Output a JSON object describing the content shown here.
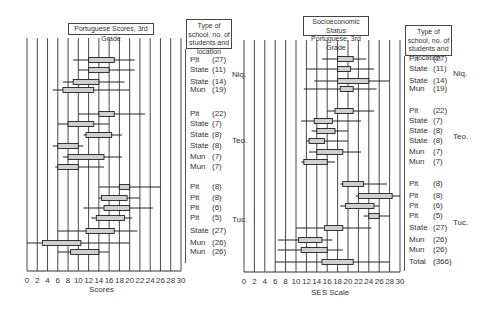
{
  "chart_data": [
    {
      "type": "boxplot",
      "title": "Portuguese Scores, 3rd Grade",
      "xlabel": "Scores",
      "ylabel": "",
      "xlim": [
        0,
        30
      ],
      "x_ticks": [
        0,
        2,
        4,
        6,
        8,
        10,
        12,
        14,
        16,
        18,
        20,
        22,
        24,
        26,
        28,
        30
      ],
      "grid": true,
      "legend_header": "Type of school, no. of students and location",
      "groups": [
        {
          "location": "Niq.",
          "rows": [
            {
              "type": "Pit",
              "n": "(27)",
              "whisker_low": 9,
              "q1": 12,
              "q3": 17,
              "whisker_high": 21
            },
            {
              "type": "State",
              "n": "(11)",
              "whisker_low": 10,
              "q1": 12,
              "q3": 16,
              "whisker_high": 21
            },
            {
              "type": "State",
              "n": "(14)",
              "whisker_low": 7,
              "q1": 9,
              "q3": 14,
              "whisker_high": 19
            },
            {
              "type": "Mun",
              "n": "(19)",
              "whisker_low": 5,
              "q1": 7,
              "q3": 13,
              "whisker_high": 20
            }
          ]
        },
        {
          "location": "Teo.",
          "rows": [
            {
              "type": "Pit",
              "n": "(22)",
              "whisker_low": 10,
              "q1": 14,
              "q3": 17,
              "whisker_high": 23
            },
            {
              "type": "State",
              "n": "(7)",
              "whisker_low": 6,
              "q1": 8,
              "q3": 13,
              "whisker_high": 16
            },
            {
              "type": "State",
              "n": "(8)",
              "whisker_low": 11,
              "q1": 11.5,
              "q3": 16.5,
              "whisker_high": 18.5
            },
            {
              "type": "State",
              "n": "(8)",
              "whisker_low": 5,
              "q1": 6,
              "q3": 10,
              "whisker_high": 11
            },
            {
              "type": "Mun",
              "n": "(7)",
              "whisker_low": 7,
              "q1": 8,
              "q3": 15,
              "whisker_high": 18.5
            },
            {
              "type": "Mun",
              "n": "(7)",
              "whisker_low": 5.5,
              "q1": 6,
              "q3": 10,
              "whisker_high": 15
            }
          ]
        },
        {
          "location": "Tuc.",
          "rows": [
            {
              "type": "Pit",
              "n": "(8)",
              "whisker_low": 14,
              "q1": 18,
              "q3": 20,
              "whisker_high": 26
            },
            {
              "type": "Pit",
              "n": "(8)",
              "whisker_low": 14,
              "q1": 14.5,
              "q3": 19.5,
              "whisker_high": 22
            },
            {
              "type": "Pit",
              "n": "(6)",
              "whisker_low": 11,
              "q1": 15,
              "q3": 20,
              "whisker_high": 24.5
            },
            {
              "type": "Pit",
              "n": "(5)",
              "whisker_low": 12.5,
              "q1": 13.5,
              "q3": 19,
              "whisker_high": 20.5
            },
            {
              "type": "State",
              "n": "(27)",
              "whisker_low": 6,
              "q1": 11.5,
              "q3": 17,
              "whisker_high": 21.5
            },
            {
              "type": "Mun",
              "n": "(26)",
              "whisker_low": 0,
              "q1": 3,
              "q3": 10.5,
              "whisker_high": 20
            },
            {
              "type": "Mun",
              "n": "(26)",
              "whisker_low": 6,
              "q1": 8.5,
              "q3": 14,
              "whisker_high": 16
            }
          ]
        }
      ]
    },
    {
      "type": "boxplot",
      "title": "Socioeconomic Status Portuguese, 3rd Grade",
      "xlabel": "SES Scale",
      "ylabel": "",
      "xlim": [
        0,
        30
      ],
      "x_ticks": [
        0,
        2,
        4,
        6,
        8,
        10,
        12,
        14,
        16,
        18,
        20,
        22,
        24,
        26,
        28,
        30
      ],
      "grid": true,
      "legend_header": "Type of school, no. of students and location",
      "groups": [
        {
          "location": "Niq.",
          "rows": [
            {
              "type": "Pit",
              "n": "(27)",
              "whisker_low": 15,
              "q1": 18,
              "q3": 21,
              "whisker_high": 23.5
            },
            {
              "type": "State",
              "n": "(11)",
              "whisker_low": 12,
              "q1": 18,
              "q3": 20.5,
              "whisker_high": 25
            },
            {
              "type": "State",
              "n": "(14)",
              "whisker_low": 13.5,
              "q1": 18,
              "q3": 24,
              "whisker_high": 28
            },
            {
              "type": "Mun",
              "n": "(19)",
              "whisker_low": 11.5,
              "q1": 18.5,
              "q3": 21,
              "whisker_high": 25.5
            }
          ]
        },
        {
          "location": "Teo.",
          "rows": [
            {
              "type": "Pit",
              "n": "(22)",
              "whisker_low": 16,
              "q1": 17.5,
              "q3": 21,
              "whisker_high": 25
            },
            {
              "type": "State",
              "n": "(7)",
              "whisker_low": 11,
              "q1": 13.5,
              "q3": 17,
              "whisker_high": 22.5
            },
            {
              "type": "State",
              "n": "(8)",
              "whisker_low": 13,
              "q1": 14,
              "q3": 17.5,
              "whisker_high": 20
            },
            {
              "type": "State",
              "n": "(8)",
              "whisker_low": 12,
              "q1": 12.5,
              "q3": 15.5,
              "whisker_high": 20
            },
            {
              "type": "Mun",
              "n": "(7)",
              "whisker_low": 12.5,
              "q1": 14,
              "q3": 19,
              "whisker_high": 22.5
            },
            {
              "type": "Mun",
              "n": "(7)",
              "whisker_low": 11,
              "q1": 11.5,
              "q3": 16,
              "whisker_high": 17.5
            }
          ]
        },
        {
          "location": "Tuc.",
          "rows": [
            {
              "type": "Pit",
              "n": "(8)",
              "whisker_low": 18.5,
              "q1": 19,
              "q3": 23,
              "whisker_high": 27.5
            },
            {
              "type": "Pit",
              "n": "(8)",
              "whisker_low": 21.5,
              "q1": 22,
              "q3": 28.5,
              "whisker_high": 30
            },
            {
              "type": "Pit",
              "n": "(6)",
              "whisker_low": 18.5,
              "q1": 19.5,
              "q3": 25,
              "whisker_high": 26
            },
            {
              "type": "Pit",
              "n": "(5)",
              "whisker_low": 23,
              "q1": 24,
              "q3": 26,
              "whisker_high": 28
            },
            {
              "type": "State",
              "n": "(27)",
              "whisker_low": 10,
              "q1": 15.5,
              "q3": 19,
              "whisker_high": 24.5
            },
            {
              "type": "Mun",
              "n": "(26)",
              "whisker_low": 6.5,
              "q1": 10.5,
              "q3": 15,
              "whisker_high": 17
            },
            {
              "type": "Mun",
              "n": "(26)",
              "whisker_low": 6.5,
              "q1": 11,
              "q3": 16,
              "whisker_high": 19
            },
            {
              "type": "Total",
              "n": "(366)",
              "whisker_low": 6,
              "q1": 15,
              "q3": 21,
              "whisker_high": 28
            }
          ]
        }
      ]
    }
  ],
  "left": {
    "title": "Portuguese Scores, 3rd Grade",
    "xlabel": "Scores",
    "legend_header": "Type of school, no. of students and location",
    "ticks": [
      "0",
      "2",
      "4",
      "6",
      "8",
      "10",
      "12",
      "14",
      "16",
      "18",
      "20",
      "22",
      "24",
      "26",
      "28",
      "30"
    ]
  },
  "right": {
    "title_line1": "Socioeconomic Status",
    "title_line2": "Portuguese, 3rd Grade",
    "xlabel": "SES Scale",
    "legend_header": "Type of school, no. of students and location",
    "ticks": [
      "0",
      "2",
      "4",
      "6",
      "8",
      "10",
      "12",
      "14",
      "16",
      "18",
      "20",
      "22",
      "24",
      "26",
      "28",
      "30"
    ]
  }
}
